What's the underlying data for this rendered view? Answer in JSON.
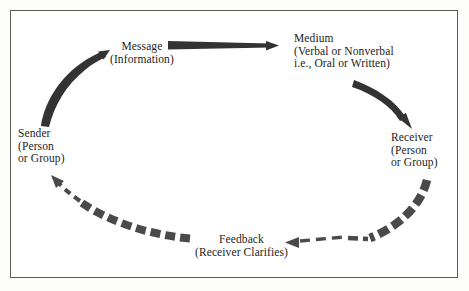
{
  "figure": {
    "frame_color": "#5a5a5a",
    "background": "#ffffff",
    "ink_color": "#1d1d1d",
    "solid_arrow_color": "#333333",
    "dashed_arrow_color": "#4a4a4a"
  },
  "nodes": {
    "message": {
      "name": "Message",
      "lines": [
        "Message",
        "(Information)"
      ]
    },
    "medium": {
      "name": "Medium",
      "lines": [
        "Medium",
        "(Verbal or Nonverbal",
        "i.e., Oral or Written)"
      ]
    },
    "receiver": {
      "name": "Receiver",
      "lines": [
        "Receiver",
        "(Person",
        "or Group)"
      ]
    },
    "sender": {
      "name": "Sender",
      "lines": [
        "Sender",
        "(Person",
        "or Group)"
      ]
    },
    "feedback": {
      "name": "Feedback",
      "lines": [
        "Feedback",
        "(Receiver Clarifies)"
      ]
    }
  },
  "connectors": [
    {
      "id": "sender-to-message",
      "from": "Sender",
      "to": "Message",
      "style": "solid-tapered-curve",
      "direction": "up-right"
    },
    {
      "id": "message-to-medium",
      "from": "Message",
      "to": "Medium",
      "style": "solid-tapered-straight",
      "direction": "right"
    },
    {
      "id": "medium-to-receiver",
      "from": "Medium",
      "to": "Receiver",
      "style": "solid-tapered-curve",
      "direction": "down-right"
    },
    {
      "id": "receiver-to-feedback",
      "from": "Receiver",
      "to": "Feedback",
      "style": "dashed-curve",
      "direction": "down-left"
    },
    {
      "id": "feedback-to-sender",
      "from": "Feedback",
      "to": "Sender",
      "style": "dashed-curve",
      "direction": "left-up"
    }
  ]
}
